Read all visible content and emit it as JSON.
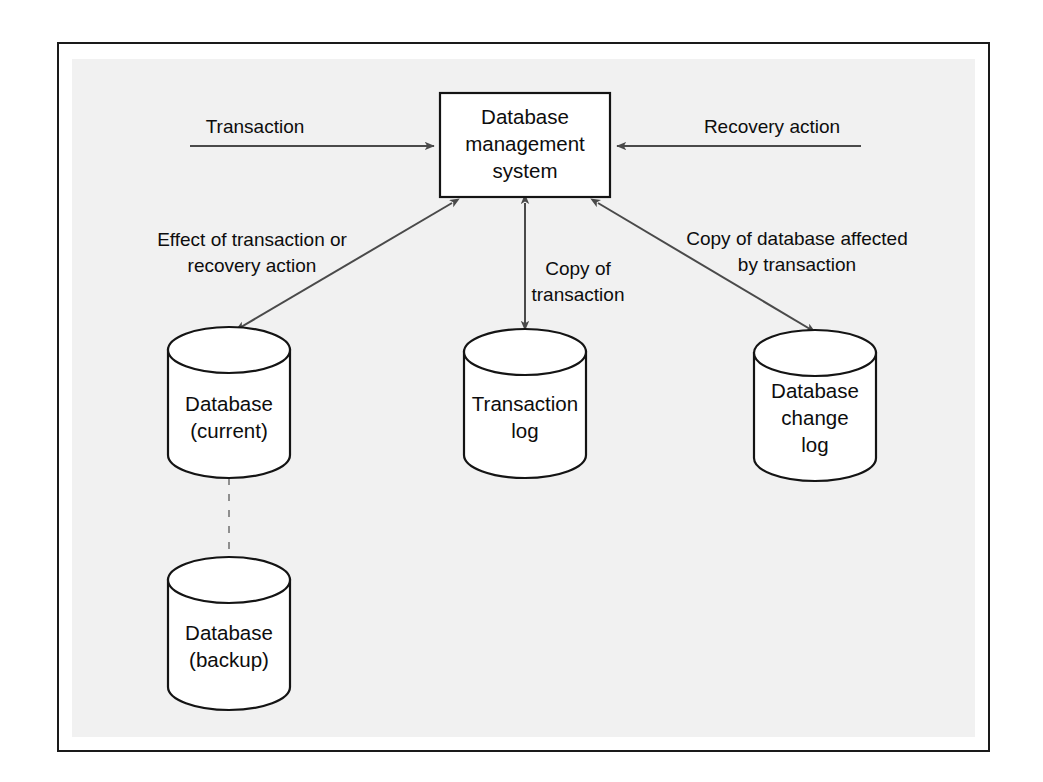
{
  "figure": {
    "background_color": "#f1f1f1",
    "page_color": "#ffffff",
    "frame_color": "#1a1a1a",
    "shape_fill": "#ffffff",
    "shape_stroke": "#141414",
    "arrow_color": "#4a4a4a",
    "dashed_color": "#8f8f8f",
    "text_color": "#0d0d0d"
  },
  "nodes": {
    "dbms": {
      "shape": "rectangle",
      "lines": [
        "Database",
        "management",
        "system"
      ],
      "line1": "Database",
      "line2": "management",
      "line3": "system"
    },
    "database_current": {
      "shape": "cylinder",
      "lines": [
        "Database",
        "(current)"
      ],
      "line1": "Database",
      "line2": "(current)"
    },
    "transaction_log": {
      "shape": "cylinder",
      "lines": [
        "Transaction",
        "log"
      ],
      "line1": "Transaction",
      "line2": "log"
    },
    "database_change_log": {
      "shape": "cylinder",
      "lines": [
        "Database",
        "change",
        "log"
      ],
      "line1": "Database",
      "line2": "change",
      "line3": "log"
    },
    "database_backup": {
      "shape": "cylinder",
      "lines": [
        "Database",
        "(backup)"
      ],
      "line1": "Database",
      "line2": "(backup)"
    }
  },
  "edges": {
    "transaction_in": {
      "label": "Transaction",
      "from": "external-left",
      "to": "dbms",
      "direction": "right",
      "style": "solid"
    },
    "recovery_action_in": {
      "label": "Recovery action",
      "from": "external-right",
      "to": "dbms",
      "direction": "left",
      "style": "solid"
    },
    "effect_of_transaction": {
      "label_line1": "Effect of transaction or",
      "label_line2": "recovery action",
      "from": "dbms",
      "to": "database_current",
      "direction": "both",
      "style": "solid"
    },
    "copy_of_transaction": {
      "label_line1": "Copy of",
      "label_line2": "transaction",
      "from": "dbms",
      "to": "transaction_log",
      "direction": "both",
      "style": "solid"
    },
    "copy_of_database": {
      "label_line1": "Copy of database affected",
      "label_line2": "by transaction",
      "from": "dbms",
      "to": "database_change_log",
      "direction": "both",
      "style": "solid"
    },
    "backup_link": {
      "label": "",
      "from": "database_current",
      "to": "database_backup",
      "direction": "none",
      "style": "dashed"
    }
  }
}
